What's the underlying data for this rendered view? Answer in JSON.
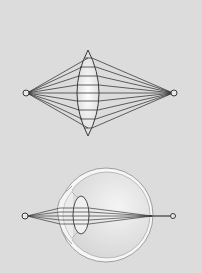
{
  "colors": {
    "background": "#dcdcdc",
    "stroke": "#3a3a3a",
    "lens_fill": "#efefef",
    "eye_fill": "#e4e4e4",
    "sclera": "#f6f6f6"
  },
  "diagram": {
    "panels": [
      {
        "id": "convex-lens",
        "description": "Biconvex lens focusing rays from a point source to a point image",
        "source_point": {
          "x": 26,
          "y": 93
        },
        "image_point": {
          "x": 174,
          "y": 93
        },
        "lens": {
          "cx": 88,
          "top": 50,
          "bottom": 136,
          "half_width": 12
        },
        "ray_count": 9
      },
      {
        "id": "human-eye",
        "description": "Cross-section of the human eye focusing rays from a point onto the retina",
        "source_point": {
          "x": 25,
          "y": 216
        },
        "image_point": {
          "x": 173,
          "y": 216
        },
        "eyeball": {
          "cx": 106,
          "cy": 215,
          "r": 47
        },
        "crystalline_lens": {
          "cx": 81,
          "cy": 215,
          "rx": 8,
          "ry": 19
        },
        "ray_count": 5
      }
    ]
  }
}
